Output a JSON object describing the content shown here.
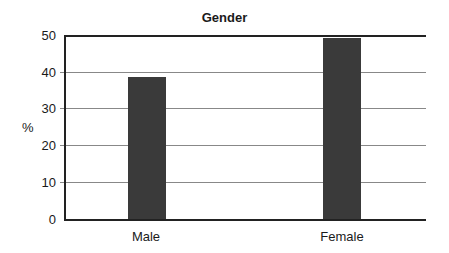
{
  "chart_data": {
    "type": "bar",
    "title": "Gender",
    "xlabel": "",
    "ylabel": "%",
    "categories": [
      "Male",
      "Female"
    ],
    "values": [
      38.7,
      49.3
    ],
    "ylim": [
      0,
      50
    ],
    "yticks": [
      "0",
      "10",
      "20",
      "30",
      "40",
      "50"
    ],
    "grid": true,
    "legend": null,
    "bar_color": "#3a3a3a"
  }
}
